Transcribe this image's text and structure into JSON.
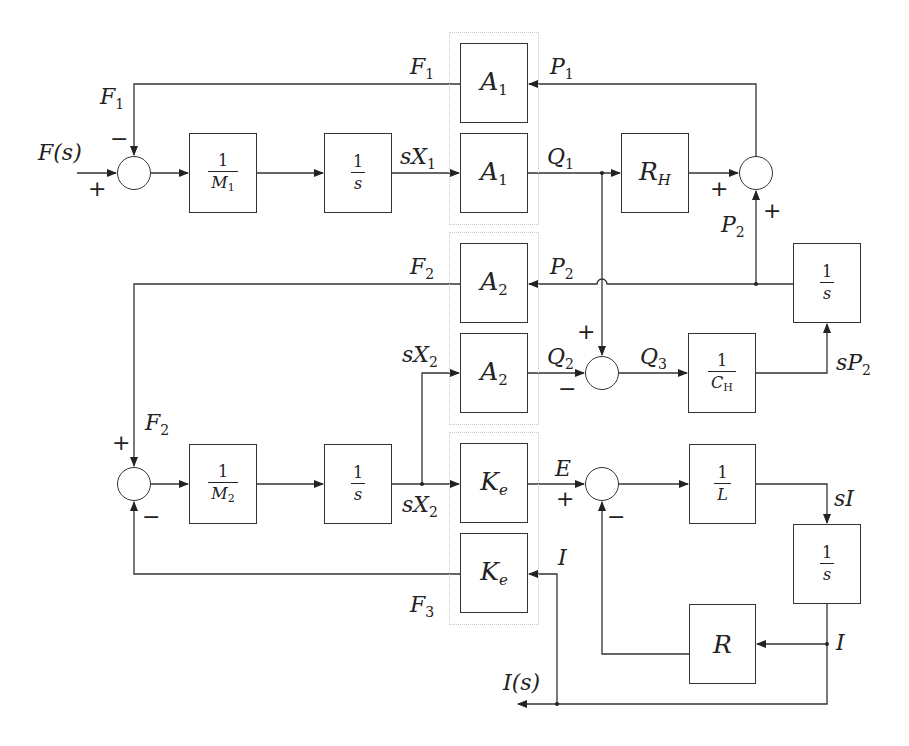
{
  "diagram": {
    "type": "block-diagram",
    "colors": {
      "line": "#333333",
      "group_border": "#c8c8c8",
      "background": "#ffffff"
    },
    "blocks": {
      "inv_m1": {
        "num": "1",
        "den": "M",
        "den_sub": "1"
      },
      "int1": {
        "num": "1",
        "den": "s"
      },
      "a1_top": {
        "main": "A",
        "sub": "1"
      },
      "a1_bot": {
        "main": "A",
        "sub": "1"
      },
      "rh": {
        "main": "R",
        "sub": "H"
      },
      "a2_top": {
        "main": "A",
        "sub": "2"
      },
      "a2_bot": {
        "main": "A",
        "sub": "2"
      },
      "int_p2": {
        "num": "1",
        "den": "s"
      },
      "inv_ch": {
        "num": "1",
        "den": "C",
        "den_sub": "H"
      },
      "inv_m2": {
        "num": "1",
        "den": "M",
        "den_sub": "2"
      },
      "int2": {
        "num": "1",
        "den": "s"
      },
      "ke_top": {
        "main": "K",
        "sub": "e"
      },
      "ke_bot": {
        "main": "K",
        "sub": "e"
      },
      "inv_l": {
        "num": "1",
        "den": "L"
      },
      "int_i": {
        "num": "1",
        "den": "s"
      },
      "r": {
        "main": "R"
      }
    },
    "signals": {
      "f_s": "F(s)",
      "f1_top": {
        "main": "F",
        "sub": "1"
      },
      "f1_left": {
        "main": "F",
        "sub": "1"
      },
      "p1": {
        "main": "P",
        "sub": "1"
      },
      "sx1": {
        "main": "sX",
        "sub": "1"
      },
      "q1": {
        "main": "Q",
        "sub": "1"
      },
      "p2_vert": {
        "main": "P",
        "sub": "2"
      },
      "f2_top": {
        "main": "F",
        "sub": "2"
      },
      "p2_line": {
        "main": "P",
        "sub": "2"
      },
      "sx2_top": {
        "main": "sX",
        "sub": "2"
      },
      "q2": {
        "main": "Q",
        "sub": "2"
      },
      "q3": {
        "main": "Q",
        "sub": "3"
      },
      "sp2": {
        "main": "sP",
        "sub": "2"
      },
      "f2_left": {
        "main": "F",
        "sub": "2"
      },
      "sx2_bot": {
        "main": "sX",
        "sub": "2"
      },
      "e": "E",
      "si": "sI",
      "i_ke": "I",
      "f3": {
        "main": "F",
        "sub": "3"
      },
      "i_r": "I",
      "i_s": "I(s)"
    },
    "signs": {
      "sum1_top": "−",
      "sum1_left": "+",
      "sum2_left": "+",
      "sum2_bottom": "+",
      "sum3_top": "+",
      "sum3_left": "−",
      "sum5_top": "+",
      "sum5_bottom": "−",
      "sum4_left": "+",
      "sum4_bottom": "−"
    }
  }
}
